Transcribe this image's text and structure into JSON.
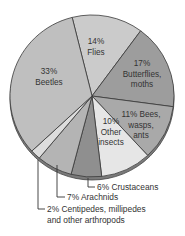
{
  "chart_data": {
    "type": "pie",
    "title": "",
    "start_angle_deg": -14,
    "direction": "clockwise",
    "slices": [
      {
        "name": "Flies",
        "value": 14,
        "label_lines": [
          "14%",
          "Flies"
        ],
        "color": "#cbcbcb"
      },
      {
        "name": "Butterflies, moths",
        "value": 17,
        "label_lines": [
          "17%",
          "Butterflies,",
          "moths"
        ],
        "color": "#9d9d9d"
      },
      {
        "name": "Bees, wasps, ants",
        "value": 11,
        "label_lines": [
          "11% Bees,",
          "wasps,",
          "ants"
        ],
        "color": "#a9a9a9"
      },
      {
        "name": "Other insects",
        "value": 10,
        "label_lines": [
          "10%",
          "Other",
          "insects"
        ],
        "color": "#e6e6e6"
      },
      {
        "name": "Crustaceans",
        "value": 6,
        "label_lines": [
          "6% Crustaceans"
        ],
        "color": "#8f8f8f",
        "external": true
      },
      {
        "name": "Arachnids",
        "value": 7,
        "label_lines": [
          "7% Arachnids"
        ],
        "color": "#b4b4b4",
        "external": true
      },
      {
        "name": "Centipedes, millipedes and other arthropods",
        "value": 2,
        "label_lines": [
          "2% Centipedes, millipedes",
          "and other arthropods"
        ],
        "color": "#dddddd",
        "external": true
      },
      {
        "name": "Beetles",
        "value": 33,
        "label_lines": [
          "33%",
          "Beetles"
        ],
        "color": "#bfbfbf"
      }
    ],
    "units": "%",
    "legend": "none (labels on/near slices)"
  }
}
